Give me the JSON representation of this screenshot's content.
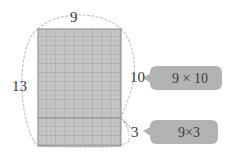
{
  "diagram": {
    "colors": {
      "grid_fill": "#c6c6c6",
      "grid_line_minor": "#b4b4b4",
      "grid_line_major": "#a0a0a0",
      "grid_border": "#9a9a9a",
      "dashed_curve": "#bdbdbd",
      "bubble_fill": "#b3b3b3",
      "text": "#3a3a3a",
      "background": "#ffffff"
    },
    "rectangle": {
      "width_label": "9",
      "height_label": "13",
      "columns": 9,
      "rows": 13,
      "split_rows": [
        10,
        3
      ]
    },
    "dimension_labels": [
      {
        "name": "top-width",
        "value": "9"
      },
      {
        "name": "left-total-height",
        "value": "13"
      },
      {
        "name": "right-upper-height",
        "value": "10"
      },
      {
        "name": "right-lower-height",
        "value": "3"
      }
    ],
    "callouts": [
      {
        "name": "upper",
        "expression": "9 × 10"
      },
      {
        "name": "lower",
        "expression": "9×3"
      }
    ]
  }
}
